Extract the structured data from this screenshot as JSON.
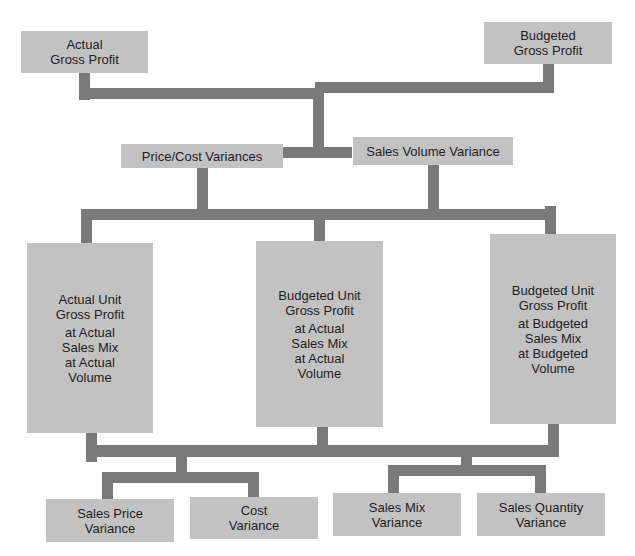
{
  "diagram": {
    "title_nodes": {
      "actual_gross_profit": [
        "Actual",
        "Gross Profit"
      ],
      "budgeted_gross_profit": [
        "Budgeted",
        "Gross Profit"
      ]
    },
    "level2": {
      "price_cost_variances": "Price/Cost Variances",
      "sales_volume_variance": "Sales Volume Variance"
    },
    "level3": {
      "actual_unit": [
        "Actual Unit",
        "Gross Profit",
        "at Actual",
        "Sales Mix",
        "at Actual",
        "Volume"
      ],
      "budgeted_unit_actual": [
        "Budgeted Unit",
        "Gross Profit",
        "at Actual",
        "Sales Mix",
        "at Actual",
        "Volume"
      ],
      "budgeted_unit_budgeted": [
        "Budgeted Unit",
        "Gross Profit",
        "at Budgeted",
        "Sales Mix",
        "at Budgeted",
        "Volume"
      ]
    },
    "level4": {
      "sales_price_variance": [
        "Sales Price",
        "Variance"
      ],
      "cost_variance": [
        "Cost",
        "Variance"
      ],
      "sales_mix_variance": [
        "Sales Mix",
        "Variance"
      ],
      "sales_quantity_variance": [
        "Sales Quantity",
        "Variance"
      ]
    },
    "colors": {
      "box_fill": "#c2c2c2",
      "connector": "#7a7a7a",
      "text": "#1e1e1e",
      "background": "#ffffff"
    }
  }
}
